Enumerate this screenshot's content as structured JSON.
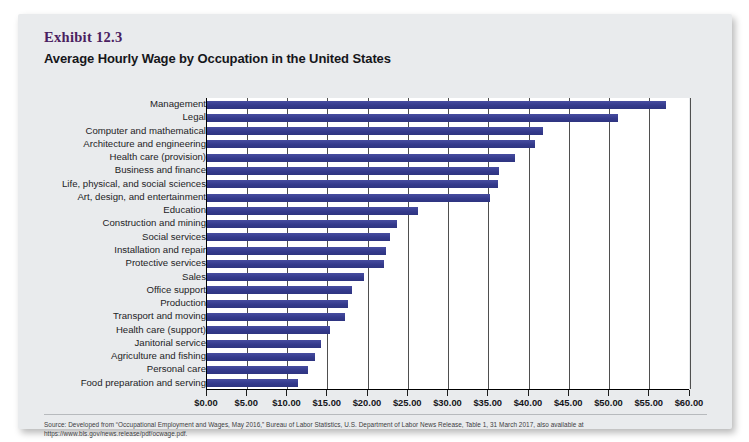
{
  "exhibit": {
    "label": "Exhibit 12.3",
    "title": "Average Hourly Wage by Occupation in the United States"
  },
  "source": {
    "text": "Source: Developed from “Occupational Employment and Wages, May 2016,” Bureau of Labor Statistics, U.S. Department of Labor News Release, Table 1, 31 March 2017, also available at https://www.bls.gov/news.release/pdf/ocwage.pdf."
  },
  "colors": {
    "bar": "#3a4091",
    "card_background": "#e9ebed",
    "plot_background": "#ffffff",
    "exhibit_label": "#4a2060",
    "axis": "#000000",
    "gridline": "#4f4f4f"
  },
  "chart_data": {
    "type": "bar",
    "orientation": "horizontal",
    "title": "Average Hourly Wage by Occupation in the United States",
    "xlabel": "",
    "ylabel": "",
    "xlim": [
      0,
      60
    ],
    "xtick_step": 5,
    "grid": true,
    "legend": false,
    "xticks": [
      0,
      5,
      10,
      15,
      20,
      25,
      30,
      35,
      40,
      45,
      50,
      55,
      60
    ],
    "xtick_labels": [
      "$0.00",
      "$5.00",
      "$10.00",
      "$15.00",
      "$20.00",
      "$25.00",
      "$30.00",
      "$35.00",
      "$40.00",
      "$45.00",
      "$50.00",
      "$55.00",
      "$60.00"
    ],
    "categories": [
      "Management",
      "Legal",
      "Computer and mathematical",
      "Architecture and engineering",
      "Health care (provision)",
      "Business and finance",
      "Life, physical, and social sciences",
      "Art, design, and entertainment",
      "Education",
      "Construction and mining",
      "Social services",
      "Installation and repair",
      "Protective services",
      "Sales",
      "Office support",
      "Production",
      "Transport and moving",
      "Health care (support)",
      "Janitorial service",
      "Agriculture and fishing",
      "Personal care",
      "Food preparation and serving"
    ],
    "values": [
      57.0,
      51.0,
      41.8,
      40.8,
      38.3,
      36.3,
      36.2,
      35.1,
      26.2,
      23.6,
      22.7,
      22.2,
      22.0,
      19.5,
      18.0,
      17.5,
      17.1,
      15.3,
      14.1,
      13.4,
      12.5,
      11.3
    ]
  }
}
